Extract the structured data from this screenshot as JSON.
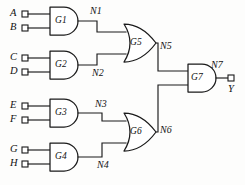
{
  "diagram": {
    "type": "logic-circuit-schematic",
    "colors": {
      "background": "#fdfdfc",
      "ink": "#1a1a1a",
      "gate_fill": "#ffffff"
    }
  },
  "inputs": [
    {
      "label": "A",
      "x": 10,
      "y": 9,
      "pad_x": 22,
      "pad_y": 14
    },
    {
      "label": "B",
      "x": 10,
      "y": 23,
      "pad_x": 22,
      "pad_y": 28
    },
    {
      "label": "C",
      "x": 10,
      "y": 53,
      "pad_x": 22,
      "pad_y": 58
    },
    {
      "label": "D",
      "x": 10,
      "y": 67,
      "pad_x": 22,
      "pad_y": 72
    },
    {
      "label": "E",
      "x": 10,
      "y": 101,
      "pad_x": 22,
      "pad_y": 106
    },
    {
      "label": "F",
      "x": 10,
      "y": 115,
      "pad_x": 22,
      "pad_y": 120
    },
    {
      "label": "G",
      "x": 10,
      "y": 145,
      "pad_x": 22,
      "pad_y": 150
    },
    {
      "label": "H",
      "x": 10,
      "y": 159,
      "pad_x": 22,
      "pad_y": 164
    }
  ],
  "outputs": [
    {
      "label": "Y",
      "x": 226,
      "y": 86,
      "pad_x": 228,
      "pad_y": 76
    }
  ],
  "gates": [
    {
      "id": "G1",
      "type": "AND",
      "label": "G1",
      "label_x": 57,
      "label_y": 17,
      "inputs": [
        "A",
        "B"
      ],
      "output": "N1"
    },
    {
      "id": "G2",
      "type": "AND",
      "label": "G2",
      "label_x": 57,
      "label_y": 61,
      "inputs": [
        "C",
        "D"
      ],
      "output": "N2"
    },
    {
      "id": "G3",
      "type": "AND",
      "label": "G3",
      "label_x": 57,
      "label_y": 109,
      "inputs": [
        "E",
        "F"
      ],
      "output": "N3"
    },
    {
      "id": "G4",
      "type": "AND",
      "label": "G4",
      "label_x": 57,
      "label_y": 153,
      "inputs": [
        "G",
        "H"
      ],
      "output": "N4"
    },
    {
      "id": "G5",
      "type": "OR",
      "label": "G5",
      "label_x": 133,
      "label_y": 39,
      "inputs": [
        "N1",
        "N2"
      ],
      "output": "N5"
    },
    {
      "id": "G6",
      "type": "OR",
      "label": "G6",
      "label_x": 133,
      "label_y": 128,
      "inputs": [
        "N3",
        "N4"
      ],
      "output": "N6"
    },
    {
      "id": "G7",
      "type": "AND",
      "label": "G7",
      "label_x": 192,
      "label_y": 76,
      "inputs": [
        "N5",
        "N6"
      ],
      "output": "N7"
    }
  ],
  "nets": [
    {
      "label": "N1",
      "x": 91,
      "y": 7
    },
    {
      "label": "N2",
      "x": 93,
      "y": 69
    },
    {
      "label": "N3",
      "x": 96,
      "y": 100
    },
    {
      "label": "N4",
      "x": 98,
      "y": 161
    },
    {
      "label": "N5",
      "x": 160,
      "y": 42
    },
    {
      "label": "N6",
      "x": 160,
      "y": 126
    },
    {
      "label": "N7",
      "x": 211,
      "y": 61
    }
  ]
}
